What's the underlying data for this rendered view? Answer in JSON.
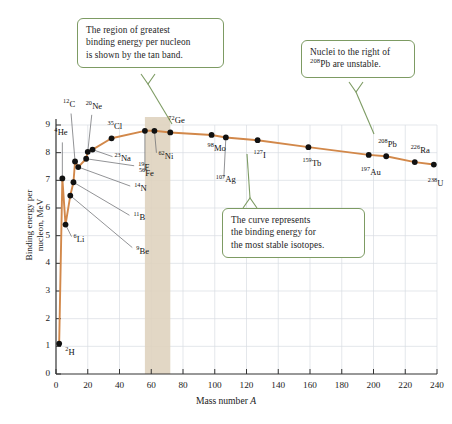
{
  "chart_data": {
    "type": "line",
    "title": "",
    "xlabel": "Mass number A",
    "ylabel": "Binding energy per nucleon, MeV",
    "xlim": [
      0,
      240
    ],
    "ylim": [
      0,
      9
    ],
    "xticks": [
      0,
      20,
      40,
      60,
      80,
      100,
      120,
      140,
      160,
      180,
      200,
      220,
      240
    ],
    "yticks": [
      0,
      1,
      2,
      3,
      4,
      5,
      6,
      7,
      8,
      9
    ],
    "grid": true,
    "legend": "none",
    "line_color": "#d2884a",
    "marker_color": "#111111",
    "band": {
      "label": "tan band",
      "color": "#ded2bd",
      "x_start": 56,
      "x_end": 72
    },
    "points": [
      {
        "label": "2H",
        "mass_superscript": "2",
        "element": "H",
        "x": 2,
        "y": 1.1
      },
      {
        "label": "4He",
        "mass_superscript": "4",
        "element": "He",
        "x": 4,
        "y": 7.07
      },
      {
        "label": "6Li",
        "mass_superscript": "6",
        "element": "Li",
        "x": 6,
        "y": 5.4
      },
      {
        "label": "9Be",
        "mass_superscript": "9",
        "element": "Be",
        "x": 9,
        "y": 6.45
      },
      {
        "label": "11B",
        "mass_superscript": "11",
        "element": "B",
        "x": 11,
        "y": 6.93
      },
      {
        "label": "12C",
        "mass_superscript": "12",
        "element": "C",
        "x": 12,
        "y": 7.68
      },
      {
        "label": "14N",
        "mass_superscript": "14",
        "element": "N",
        "x": 14,
        "y": 7.48
      },
      {
        "label": "19F",
        "mass_superscript": "19",
        "element": "F",
        "x": 19,
        "y": 7.78
      },
      {
        "label": "20Ne",
        "mass_superscript": "20",
        "element": "Ne",
        "x": 20,
        "y": 8.03
      },
      {
        "label": "23Na",
        "mass_superscript": "23",
        "element": "Na",
        "x": 23,
        "y": 8.11
      },
      {
        "label": "35Cl",
        "mass_superscript": "35",
        "element": "Cl",
        "x": 35,
        "y": 8.52
      },
      {
        "label": "56Fe",
        "mass_superscript": "56",
        "element": "Fe",
        "x": 56,
        "y": 8.79
      },
      {
        "label": "62Ni",
        "mass_superscript": "62",
        "element": "Ni",
        "x": 62,
        "y": 8.79
      },
      {
        "label": "72Ge",
        "mass_superscript": "72",
        "element": "Ge",
        "x": 72,
        "y": 8.73
      },
      {
        "label": "98Mo",
        "mass_superscript": "98",
        "element": "Mo",
        "x": 98,
        "y": 8.64
      },
      {
        "label": "107Ag",
        "mass_superscript": "107",
        "element": "Ag",
        "x": 107,
        "y": 8.55
      },
      {
        "label": "127I",
        "mass_superscript": "127",
        "element": "I",
        "x": 127,
        "y": 8.45
      },
      {
        "label": "159Tb",
        "mass_superscript": "159",
        "element": "Tb",
        "x": 159,
        "y": 8.2
      },
      {
        "label": "197Au",
        "mass_superscript": "197",
        "element": "Au",
        "x": 197,
        "y": 7.92
      },
      {
        "label": "208Pb",
        "mass_superscript": "208",
        "element": "Pb",
        "x": 208,
        "y": 7.87
      },
      {
        "label": "226Ra",
        "mass_superscript": "226",
        "element": "Ra",
        "x": 226,
        "y": 7.66
      },
      {
        "label": "238U",
        "mass_superscript": "238",
        "element": "U",
        "x": 238,
        "y": 7.57
      }
    ]
  },
  "callouts": [
    {
      "name": "tan-band-callout",
      "lines": [
        "The region of greatest",
        "binding energy per nucleon",
        "is shown by the tan band."
      ]
    },
    {
      "name": "unstable-nuclei-callout",
      "line1": "Nuclei to the right of",
      "sup": "208",
      "line2_rest": "Pb are unstable."
    },
    {
      "name": "curve-meaning-callout",
      "lines": [
        "The curve represents",
        "the binding energy for",
        "the most stable isotopes."
      ]
    }
  ],
  "axis": {
    "x_title_text": "Mass number ",
    "x_title_italic": "A",
    "y_title_line1": "Binding energy per",
    "y_title_line2": "nucleon, MeV"
  }
}
